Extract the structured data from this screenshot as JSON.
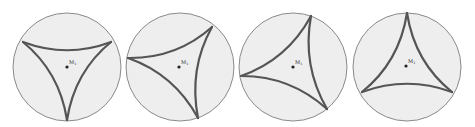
{
  "figure": {
    "panels": [
      {
        "id": 1,
        "label": "M",
        "sub": "1",
        "cx": 67,
        "cy": 67,
        "r": 54,
        "vertices": [
          [
            23,
            42
          ],
          [
            111,
            42
          ],
          [
            67,
            120
          ]
        ],
        "bulge": 0.33,
        "dot": [
          67,
          67
        ]
      },
      {
        "id": 2,
        "label": "M",
        "sub": "1",
        "cx": 180,
        "cy": 67,
        "r": 54,
        "vertices": [
          [
            128,
            58
          ],
          [
            212,
            27
          ],
          [
            198,
            118
          ]
        ],
        "bulge": 0.33,
        "dot": [
          179,
          67
        ]
      },
      {
        "id": 3,
        "label": "M",
        "sub": "1",
        "cx": 293,
        "cy": 67,
        "r": 54,
        "vertices": [
          [
            241,
            76
          ],
          [
            311,
            16
          ],
          [
            327,
            109
          ]
        ],
        "bulge": 0.33,
        "dot": [
          293,
          67
        ]
      },
      {
        "id": 4,
        "label": "M",
        "sub": "1",
        "cx": 407,
        "cy": 67,
        "r": 54,
        "vertices": [
          [
            362,
            92
          ],
          [
            407,
            13
          ],
          [
            452,
            92
          ]
        ],
        "bulge": 0.33,
        "dot": [
          406,
          66
        ]
      }
    ],
    "colors": {
      "disk_fill": "#eeeeee",
      "disk_stroke": "#8a8a8a",
      "arc": "#555555",
      "dot": "#222222"
    }
  }
}
